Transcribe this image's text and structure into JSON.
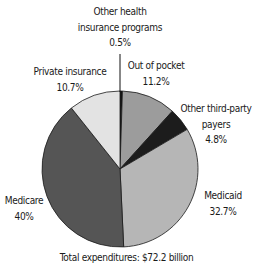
{
  "chart_data": {
    "type": "pie",
    "title": "",
    "start_angle_deg": 0,
    "direction": "clockwise",
    "slices": [
      {
        "label": "Other health insurance programs",
        "value": 0.5,
        "display": "0.5%",
        "color": "#111111"
      },
      {
        "label": "Out of pocket",
        "value": 11.2,
        "display": "11.2%",
        "color": "#9c9c9c"
      },
      {
        "label": "Other third-party payers",
        "value": 4.8,
        "display": "4.8%",
        "color": "#1c1c1c"
      },
      {
        "label": "Medicaid",
        "value": 32.7,
        "display": "32.7%",
        "color": "#b6b6b6"
      },
      {
        "label": "Medicare",
        "value": 40,
        "display": "40%",
        "color": "#555555"
      },
      {
        "label": "Private insurance",
        "value": 10.7,
        "display": "10.7%",
        "color": "#e3e3e3"
      }
    ],
    "footnote": "Total expenditures: $72.2 billion",
    "legend": "none (direct labels)"
  },
  "labels": {
    "other_health": {
      "line1": "Other health",
      "line2": "insurance programs",
      "pct": "0.5%"
    },
    "out_of_pocket": {
      "line1": "Out of pocket",
      "pct": "11.2%"
    },
    "other_third_party": {
      "line1": "Other third-party",
      "line2": "payers",
      "pct": "4.8%"
    },
    "medicaid": {
      "line1": "Medicaid",
      "pct": "32.7%"
    },
    "medicare": {
      "line1": "Medicare",
      "pct": "40%"
    },
    "private_insurance": {
      "line1": "Private insurance",
      "pct": "10.7%"
    }
  },
  "footer": {
    "text": "Total expenditures: $72.2 billion"
  }
}
